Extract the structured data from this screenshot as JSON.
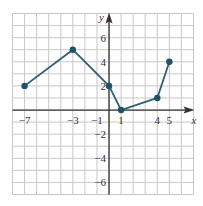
{
  "chart_data": {
    "type": "line",
    "title": "",
    "xlabel": "x",
    "ylabel": "y",
    "xlim": [
      -8,
      7
    ],
    "ylim": [
      -7,
      8
    ],
    "grid": true,
    "x_tick_labels": [
      "-7",
      "-3",
      "-1",
      "1",
      "4",
      "5"
    ],
    "x_ticks": [
      -7,
      -3,
      -1,
      1,
      4,
      5
    ],
    "y_tick_labels": [
      "6",
      "4",
      "2",
      "-2",
      "-4",
      "-6"
    ],
    "y_ticks": [
      6,
      4,
      2,
      -2,
      -4,
      -6
    ],
    "series": [
      {
        "name": "piecewise",
        "x": [
          -7,
          -3,
          0,
          1,
          4,
          5
        ],
        "y": [
          2,
          5,
          2,
          0,
          1,
          4
        ]
      }
    ]
  },
  "colors": {
    "line": "#2c5f73",
    "point": "#1f5266",
    "grid": "#c8c8c8",
    "axis": "#333333"
  },
  "labels": {
    "x_axis": "x",
    "y_axis": "y"
  }
}
